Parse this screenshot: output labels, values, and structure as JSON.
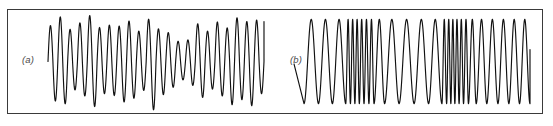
{
  "figure": {
    "background_color": "#ffffff",
    "frame_color": "#3a3a3a",
    "trace_color": "#111111"
  },
  "panels": [
    {
      "id": "a",
      "label": "(a)",
      "description": "amplitude-modulated oscillation",
      "chart_index": 0
    },
    {
      "id": "b",
      "label": "(b)",
      "description": "frequency-modulated oscillation",
      "chart_index": 1
    }
  ],
  "chart_data": [
    {
      "type": "line",
      "title": "(a)",
      "xlabel": "",
      "ylabel": "",
      "grid": false,
      "legend": "none",
      "xlim": [
        0,
        1
      ],
      "ylim": [
        -1.12,
        1.12
      ],
      "modulation": "amplitude",
      "carrier_cycles": 21.5,
      "phase_offset_rad": 1.5707963,
      "samples_per_cycle": 48,
      "peak_amplitudes": [
        0.78,
        0.97,
        0.7,
        0.84,
        1.0,
        0.74,
        0.79,
        0.77,
        0.88,
        0.66,
        0.92,
        0.71,
        0.63,
        0.44,
        0.47,
        0.82,
        0.66,
        0.86,
        0.73,
        0.95,
        0.87,
        0.9
      ],
      "trough_amplitudes": [
        -0.86,
        -0.92,
        -0.62,
        -0.75,
        -0.98,
        -0.7,
        -0.74,
        -0.88,
        -0.8,
        -0.63,
        -1.05,
        -0.72,
        -0.56,
        -0.4,
        -0.52,
        -0.78,
        -0.6,
        -0.75,
        -0.94,
        -0.83,
        -0.96,
        -0.7
      ]
    },
    {
      "type": "line",
      "title": "(b)",
      "xlabel": "",
      "ylabel": "",
      "grid": false,
      "legend": "none",
      "xlim": [
        0,
        1
      ],
      "ylim": [
        -1.05,
        1.05
      ],
      "modulation": "frequency",
      "constant_amplitude": 0.86,
      "start_value": -0.05,
      "samples_per_cycle": 44,
      "cycle_widths_relative": [
        1.3,
        1.25,
        1.2,
        0.42,
        0.4,
        0.4,
        0.42,
        0.44,
        0.46,
        0.95,
        1.3,
        1.35,
        1.3,
        1.2,
        0.42,
        0.38,
        0.36,
        0.38,
        0.4,
        0.44,
        0.7,
        0.95,
        1.0,
        0.98,
        0.96,
        0.94
      ]
    }
  ]
}
